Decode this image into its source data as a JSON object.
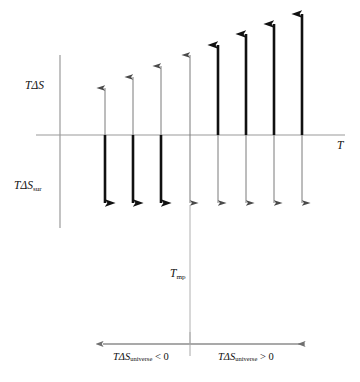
{
  "figure": {
    "type": "thermodynamics-entropy-diagram",
    "background": "#ffffff",
    "colors": {
      "axis": "#8d8d8d",
      "thin_arrow": "#7a7a7a",
      "thick_arrow": "#111111",
      "guide_line": "#a8a8a8",
      "text": "#111111"
    }
  },
  "labels": {
    "y_axis": {
      "base": "TΔS",
      "sub": ""
    },
    "y_axis_lower": {
      "base": "TΔS",
      "sub": "sur"
    },
    "x_axis": "T",
    "transition_point": {
      "base": "T",
      "sub": "mp"
    },
    "left_region": {
      "base": "TΔS",
      "sub": "universe",
      "op": " < 0"
    },
    "right_region": {
      "base": "TΔS",
      "sub": "universe",
      "op": " > 0"
    }
  },
  "axes": {
    "y_axis": {
      "x": 60,
      "y_top": 55,
      "y_bottom": 228
    },
    "x_axis": {
      "y": 135,
      "x_left": 36,
      "x_right": 345,
      "has_arrow_head": false
    },
    "zero_line_value": 0,
    "bottom_axis": {
      "y": 344,
      "x_left": 103,
      "x_right": 305,
      "left_arrow": true,
      "right_arrow": true,
      "divider_x": 190,
      "divider_y_top": 332,
      "divider_y_bottom": 356
    },
    "guide_line": {
      "x": 190,
      "y_top": 205,
      "y_bottom": 344
    }
  },
  "chart_data": {
    "type": "bar",
    "title": "",
    "xlabel": "T",
    "ylabel": "TΔS",
    "grid": false,
    "legend": null,
    "categories": [
      "T1",
      "T2",
      "T3",
      "T4",
      "T5",
      "T6",
      "T7",
      "T8"
    ],
    "series": [
      {
        "name": "TΔS (system, upward)",
        "values": [
          47,
          57,
          68,
          79,
          90,
          101,
          111,
          122
        ]
      },
      {
        "name": "TΔS_sur (surroundings, downward)",
        "values": [
          -68,
          -68,
          -68,
          -68,
          -68,
          -68,
          -68,
          -68
        ]
      }
    ],
    "arrows": [
      {
        "x": 105,
        "up_tip_y": 88,
        "down_tip_y": 203,
        "thick_segment": "down",
        "region": "left"
      },
      {
        "x": 133,
        "up_tip_y": 77,
        "down_tip_y": 203,
        "thick_segment": "down",
        "region": "left"
      },
      {
        "x": 161,
        "up_tip_y": 66,
        "down_tip_y": 203,
        "thick_segment": "down",
        "region": "left"
      },
      {
        "x": 190,
        "up_tip_y": 55,
        "down_tip_y": 203,
        "thick_segment": "none",
        "region": "transition"
      },
      {
        "x": 218,
        "up_tip_y": 45,
        "down_tip_y": 203,
        "thick_segment": "up",
        "region": "right"
      },
      {
        "x": 246,
        "up_tip_y": 34,
        "down_tip_y": 203,
        "thick_segment": "up",
        "region": "right"
      },
      {
        "x": 274,
        "up_tip_y": 24,
        "down_tip_y": 203,
        "thick_segment": "up",
        "region": "right"
      },
      {
        "x": 302,
        "up_tip_y": 14,
        "down_tip_y": 203,
        "thick_segment": "up",
        "region": "right"
      }
    ]
  }
}
